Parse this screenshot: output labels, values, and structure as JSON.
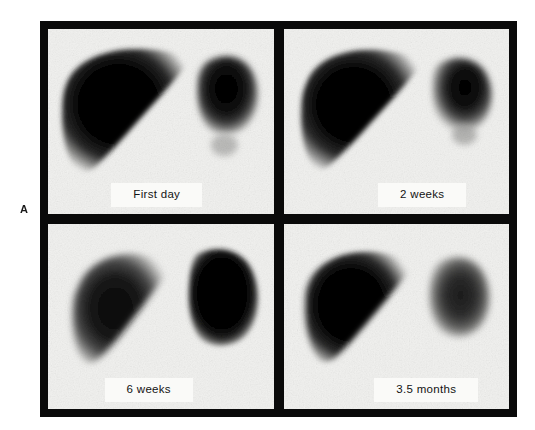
{
  "figure": {
    "panel_letter": "A",
    "modality": "radionuclide liver-spleen scintigraphy",
    "layout": {
      "rows": 2,
      "columns": 2,
      "frame_color": "#0a0a0a",
      "scan_background": "#f1f1ef"
    }
  },
  "scans": [
    {
      "id": "scan-first-day",
      "label": "First day",
      "position": "top-left",
      "organs": [
        {
          "name": "liver",
          "side": "left",
          "relative_size": "large",
          "uptake": "intense"
        },
        {
          "name": "spleen",
          "side": "right",
          "relative_size": "moderate",
          "uptake": "intense"
        }
      ]
    },
    {
      "id": "scan-2-weeks",
      "label": "2 weeks",
      "position": "top-right",
      "organs": [
        {
          "name": "liver",
          "side": "left",
          "relative_size": "large",
          "uptake": "intense"
        },
        {
          "name": "spleen",
          "side": "right",
          "relative_size": "moderate",
          "uptake": "intense"
        }
      ]
    },
    {
      "id": "scan-6-weeks",
      "label": "6 weeks",
      "position": "bottom-left",
      "organs": [
        {
          "name": "liver",
          "side": "left",
          "relative_size": "reduced",
          "uptake": "moderate"
        },
        {
          "name": "spleen",
          "side": "right",
          "relative_size": "enlarged",
          "uptake": "intense"
        }
      ]
    },
    {
      "id": "scan-3-5-months",
      "label": "3.5 months",
      "position": "bottom-right",
      "organs": [
        {
          "name": "liver",
          "side": "left",
          "relative_size": "large",
          "uptake": "intense"
        },
        {
          "name": "spleen",
          "side": "right",
          "relative_size": "moderate",
          "uptake": "faint"
        }
      ]
    }
  ]
}
